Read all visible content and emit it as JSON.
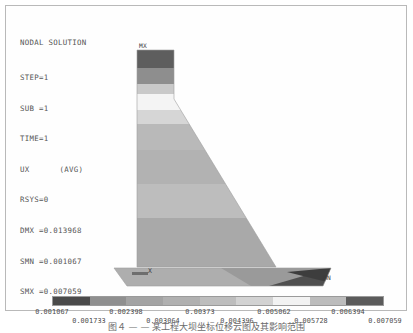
{
  "window": {
    "title": "NODAL SOLUTION"
  },
  "header": {
    "title": "NODAL SOLUTION",
    "lines": [
      {
        "label": "STEP=1",
        "extra": ""
      },
      {
        "label": "SUB =1",
        "extra": ""
      },
      {
        "label": "TIME=1",
        "extra": ""
      },
      {
        "label": "UX",
        "extra": "(AVG)"
      },
      {
        "label": "RSYS=0",
        "extra": ""
      },
      {
        "label": "DMX =0.013968",
        "extra": ""
      },
      {
        "label": "SMN =0.001067",
        "extra": ""
      },
      {
        "label": "SMX =0.007059",
        "extra": ""
      }
    ],
    "step": "STEP=1",
    "sub": "SUB =1",
    "time": "TIME=1",
    "component": "UX",
    "avg": "(AVG)",
    "rsys": "RSYS=0",
    "dmx": "DMX =0.013968",
    "smn": "SMN =0.001067",
    "smx": "SMX =0.007059"
  },
  "model": {
    "max_marker": "MX",
    "min_marker": "MN",
    "axis_label": "X",
    "background": "#ffffff"
  },
  "chart_data": {
    "type": "heatmap",
    "title": "NODAL SOLUTION",
    "subtitle": "UX (AVG)",
    "colormap_style": "grayscale-banded",
    "value_min": 0.001067,
    "value_max": 0.007059,
    "band_count": 9,
    "legend_position": "bottom",
    "tick_labels_upper": [
      "0.001067",
      "0.002398",
      "0.00373",
      "0.005062",
      "0.006394"
    ],
    "tick_labels_lower": [
      "0.001733",
      "0.003064",
      "0.004396",
      "0.005728",
      "0.007059"
    ],
    "ticks": [
      {
        "row": "upper",
        "value": 0.001067,
        "label": "0.001067",
        "pos": 46
      },
      {
        "row": "lower",
        "value": 0.001733,
        "label": "0.001733",
        "pos": 83
      },
      {
        "row": "upper",
        "value": 0.002398,
        "label": "0.002398",
        "pos": 120
      },
      {
        "row": "lower",
        "value": 0.003064,
        "label": "0.003064",
        "pos": 157
      },
      {
        "row": "upper",
        "value": 0.00373,
        "label": "0.00373",
        "pos": 194
      },
      {
        "row": "lower",
        "value": 0.004396,
        "label": "0.004396",
        "pos": 231
      },
      {
        "row": "upper",
        "value": 0.005062,
        "label": "0.005062",
        "pos": 268
      },
      {
        "row": "lower",
        "value": 0.005728,
        "label": "0.005728",
        "pos": 305
      },
      {
        "row": "upper",
        "value": 0.006394,
        "label": "0.006394",
        "pos": 342
      },
      {
        "row": "lower",
        "value": 0.007059,
        "label": "0.007059",
        "pos": 379
      }
    ],
    "bands": [
      {
        "index": 0,
        "range": [
          0.001067,
          0.001733
        ],
        "color": "#4a4a4a"
      },
      {
        "index": 1,
        "range": [
          0.001733,
          0.002398
        ],
        "color": "#8f8f8f"
      },
      {
        "index": 2,
        "range": [
          0.002398,
          0.003064
        ],
        "color": "#a3a3a3"
      },
      {
        "index": 3,
        "range": [
          0.003064,
          0.00373
        ],
        "color": "#b0b0b0"
      },
      {
        "index": 4,
        "range": [
          0.00373,
          0.004396
        ],
        "color": "#bdbdbd"
      },
      {
        "index": 5,
        "range": [
          0.004396,
          0.005062
        ],
        "color": "#d2d2d2"
      },
      {
        "index": 6,
        "range": [
          0.005062,
          0.005728
        ],
        "color": "#f2f2f2"
      },
      {
        "index": 7,
        "range": [
          0.005728,
          0.006394
        ],
        "color": "#bcbcbc"
      },
      {
        "index": 8,
        "range": [
          0.006394,
          0.007059
        ],
        "color": "#5b5b5b"
      }
    ],
    "annotations": [
      {
        "text": "MX",
        "meaning": "location of maximum value"
      },
      {
        "text": "MN",
        "meaning": "location of minimum value"
      }
    ],
    "geometry_description": "Tapered cantilever wall/pylon on a horizontal base slab, contoured by UX displacement"
  },
  "caption": {
    "text": "图４ — —  某工程大坝坐标位移云图及其影响范围"
  }
}
